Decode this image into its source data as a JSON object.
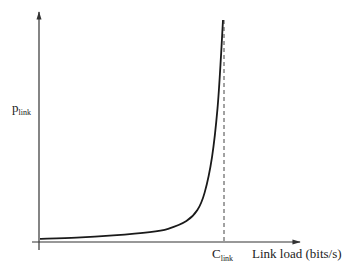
{
  "chart_data": {
    "type": "line",
    "title": "",
    "ylabel": "p",
    "ylabel_subscript": "link",
    "xlabel": "Link load (bits/s)",
    "x_tick_labels": [
      {
        "main": "C",
        "subscript": "link",
        "position": "capacity"
      }
    ],
    "series": [
      {
        "name": "p_link vs link load",
        "description": "Convex curve rising slowly then sharply, asymptotic to vertical dashed line at C_link",
        "x_fraction_of_capacity": [
          0.0,
          0.2,
          0.4,
          0.6,
          0.7,
          0.8,
          0.86,
          0.9,
          0.94,
          0.97,
          0.99,
          1.0
        ],
        "y_relative": [
          0.01,
          0.015,
          0.025,
          0.04,
          0.055,
          0.09,
          0.14,
          0.22,
          0.38,
          0.6,
          0.85,
          1.0
        ]
      }
    ],
    "annotations": [
      {
        "type": "vertical-dashed-line",
        "at": "C_link"
      }
    ],
    "grid": false,
    "legend": null
  },
  "colors": {
    "axis": "#333333",
    "curve": "#1a1a1a",
    "dashed": "#444444",
    "text": "#222222"
  }
}
